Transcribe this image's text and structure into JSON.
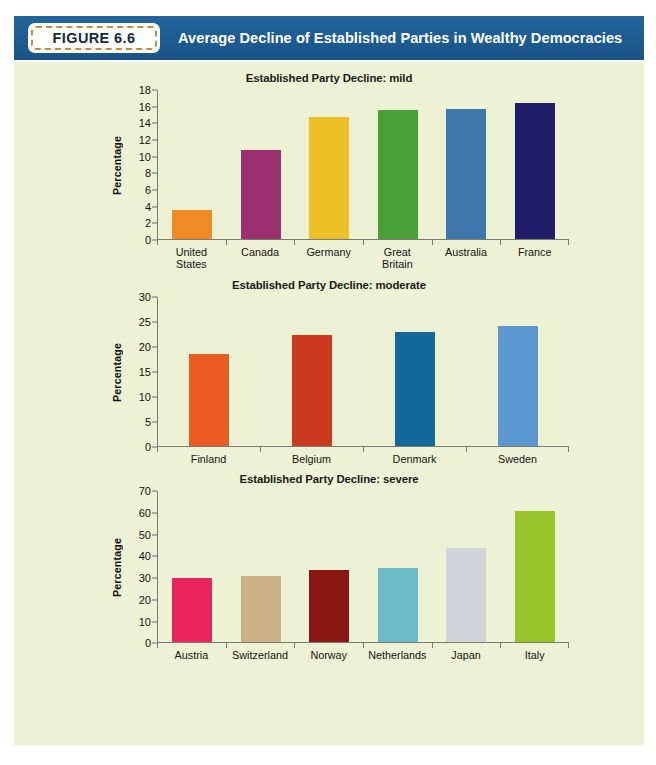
{
  "figure": {
    "number_label": "FIGURE 6.6",
    "banner_title": "Average Decline of Established Parties in Wealthy Democracies",
    "banner_color": "#1e5f94",
    "panel_background": "#eef2d4",
    "figure_box_border_color": "#c98a3c"
  },
  "chart_data": [
    {
      "type": "bar",
      "title": "Established Party Decline: mild",
      "xlabel": "",
      "ylabel": "Percentage",
      "ylim": [
        0,
        18
      ],
      "yticks": [
        0,
        2,
        4,
        6,
        8,
        10,
        12,
        14,
        16,
        18
      ],
      "grid": false,
      "legend": "none",
      "categories": [
        "United\nStates",
        "Canada",
        "Germany",
        "Great\nBritain",
        "Australia",
        "France"
      ],
      "values": [
        3.5,
        10.8,
        14.8,
        15.6,
        15.7,
        16.4
      ],
      "colors": [
        "#ef8a25",
        "#9c3073",
        "#ecc127",
        "#49a039",
        "#3f76ab",
        "#221d69"
      ]
    },
    {
      "type": "bar",
      "title": "Established Party Decline: moderate",
      "xlabel": "",
      "ylabel": "Percentage",
      "ylim": [
        0,
        30
      ],
      "yticks": [
        0,
        5,
        10,
        15,
        20,
        25,
        30
      ],
      "grid": false,
      "legend": "none",
      "categories": [
        "Finland",
        "Belgium",
        "Denmark",
        "Sweden"
      ],
      "values": [
        18.4,
        22.4,
        22.9,
        24.1
      ],
      "colors": [
        "#ea5c23",
        "#cc3a1f",
        "#14699c",
        "#5b97d1"
      ]
    },
    {
      "type": "bar",
      "title": "Established Party Decline: severe",
      "xlabel": "",
      "ylabel": "Percentage",
      "ylim": [
        0,
        70
      ],
      "yticks": [
        0,
        10,
        20,
        30,
        40,
        50,
        60,
        70
      ],
      "grid": false,
      "legend": "none",
      "categories": [
        "Austria",
        "Switzerland",
        "Norway",
        "Netherlands",
        "Japan",
        "Italy"
      ],
      "values": [
        30.0,
        30.5,
        33.3,
        34.2,
        43.5,
        61.0
      ],
      "colors": [
        "#e8245e",
        "#cbb387",
        "#8b1510",
        "#6bbcc6",
        "#d2d4d9",
        "#95c42b"
      ]
    }
  ]
}
